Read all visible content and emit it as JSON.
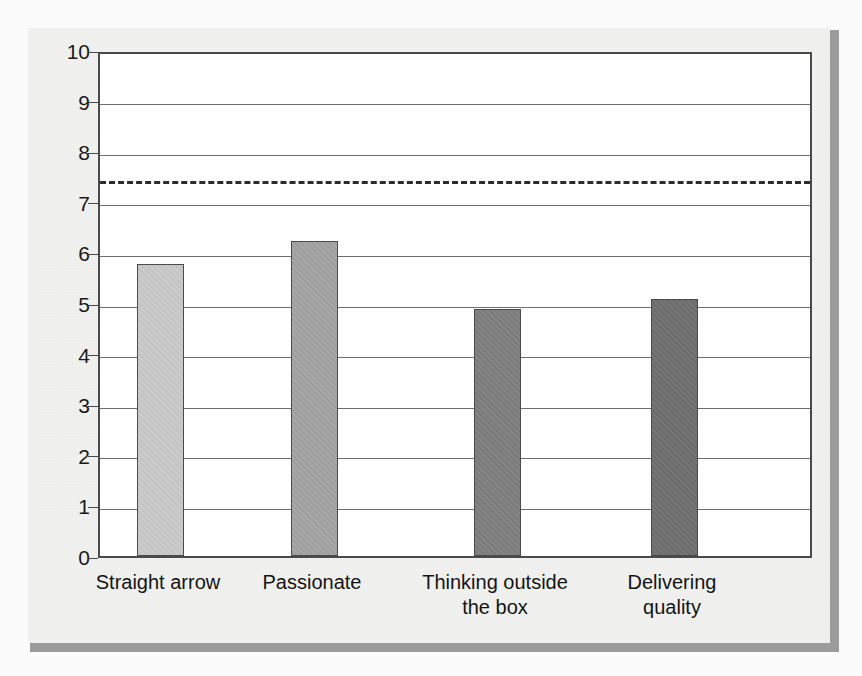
{
  "figure": {
    "background_color": "#f2f2f1",
    "plot_background": "#ffffff",
    "shadow_color": "#9b9b9b",
    "axis_color": "#4a4a4a",
    "gridline_color": "#6e6e6e"
  },
  "chart_data": {
    "type": "bar",
    "title": "",
    "subtitle": "",
    "xlabel": "",
    "ylabel": "",
    "ylim": [
      0,
      10
    ],
    "ytick_step": 1,
    "yticks": [
      "10",
      "9",
      "8",
      "7",
      "6",
      "5",
      "4",
      "3",
      "2",
      "1",
      "0"
    ],
    "grid": true,
    "grid_axis": "y",
    "legend": false,
    "legend_position": "none",
    "categories": [
      "Straight arrow",
      "Passionate",
      "Thinking outside the box",
      "Delivering quality"
    ],
    "category_label_lines": [
      [
        "Straight arrow"
      ],
      [
        "Passionate"
      ],
      [
        "Thinking outside",
        "the box"
      ],
      [
        "Delivering",
        "quality"
      ]
    ],
    "values": [
      5.78,
      6.22,
      4.88,
      5.08
    ],
    "bar_colors": [
      "#c9c9c9",
      "#a3a3a3",
      "#7e7e7e",
      "#6e6e6e"
    ],
    "bar_edge_color": "#4b4b4b",
    "annotations": [
      {
        "name": "benchmark-line",
        "type": "horizontal-dashed-line",
        "value": 7.5,
        "color": "#2c2c2c",
        "label": ""
      }
    ]
  }
}
